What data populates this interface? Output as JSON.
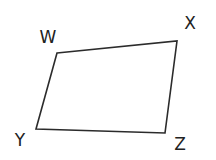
{
  "diagram": {
    "type": "quadrilateral",
    "stroke_color": "#2b2b2b",
    "vertices": [
      {
        "name": "W",
        "x": 57,
        "y": 53,
        "label_x": 48,
        "label_y": 43
      },
      {
        "name": "X",
        "x": 177,
        "y": 41,
        "label_x": 190,
        "label_y": 29
      },
      {
        "name": "Z",
        "x": 165,
        "y": 133,
        "label_x": 180,
        "label_y": 150
      },
      {
        "name": "Y",
        "x": 36,
        "y": 129,
        "label_x": 20,
        "label_y": 145
      }
    ],
    "labels": {
      "w": "W",
      "x": "X",
      "y": "Y",
      "z": "Z"
    }
  }
}
